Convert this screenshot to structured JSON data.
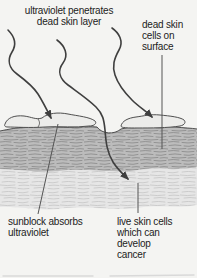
{
  "diagram": {
    "title_implied": "ultraviolet and skin layers",
    "labels": {
      "uv_penetrates": "ultraviolet penetrates\ndead skin layer",
      "dead_skin_cells": "dead skin\ncells on\nsurface",
      "sunblock": "sunblock absorbs\nultraviolet",
      "live_cells": "live skin cells\nwhich can\ndevelop\ncancer"
    },
    "colors": {
      "background": "#f4f4f2",
      "dead_layer": "#bcbcbc",
      "dead_layer_texture": "#8d8d8d",
      "live_layer": "#e6e6e6",
      "live_layer_texture": "#c8c8c8",
      "surface_cell": "#ececea",
      "outline": "#4f4f4f",
      "ray": "#3f3f3f",
      "leader": "#555555",
      "text": "#1c1c1c",
      "artifact": "#d9d9d9"
    }
  }
}
